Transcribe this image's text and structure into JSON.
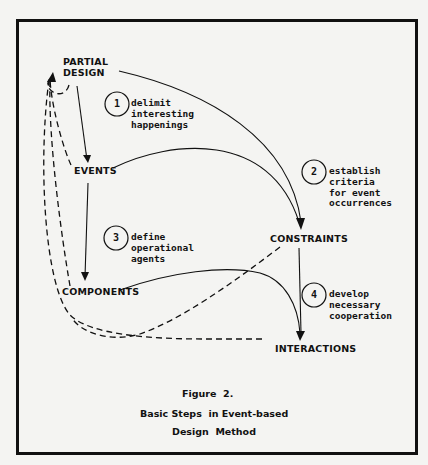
{
  "figure": {
    "nodes": {
      "partial_design": "PARTIAL\nDESIGN",
      "events": "EVENTS",
      "constraints": "CONSTRAINTS",
      "components": "COMPONENTS",
      "interactions": "INTERACTIONS"
    },
    "steps": [
      {
        "number": "1",
        "text": "delimit\ninteresting\nhappenings"
      },
      {
        "number": "2",
        "text": "establish\ncriteria\nfor event\noccurrences"
      },
      {
        "number": "3",
        "text": "define\noperational\nagents"
      },
      {
        "number": "4",
        "text": "develop\nnecessary\ncooperation"
      }
    ],
    "caption": {
      "label": "Figure  2.",
      "title_line1": "Basic Steps  in Event-based",
      "title_line2": "Design  Method"
    },
    "colors": {
      "ink": "#111111",
      "paper": "#f4f4f2"
    }
  }
}
